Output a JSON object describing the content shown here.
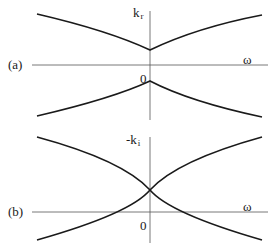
{
  "figure": {
    "panels": [
      {
        "id": "a",
        "panel_label": "(a)",
        "y_axis_label": "k",
        "y_axis_subscript": "r",
        "x_axis_label": "ω",
        "origin_label": "0",
        "description": "Real part of wavenumber vs frequency: two branches separated by a gap, upper branch with minimum at ω=0, lower branch with maximum at ω=0"
      },
      {
        "id": "b",
        "panel_label": "(b)",
        "y_axis_label": "-k",
        "y_axis_subscript": "i",
        "x_axis_label": "ω",
        "origin_label": "0",
        "description": "Negative imaginary part of wavenumber vs frequency: two branches crossing at ω=0 above the axis"
      }
    ],
    "colors": {
      "curve": "#1a1a1a",
      "axis": "#555555",
      "background": "#ffffff"
    }
  }
}
